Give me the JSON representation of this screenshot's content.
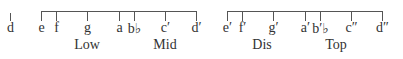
{
  "diagram": {
    "type": "pitch-range",
    "lone_note": {
      "label": "d",
      "x": 10
    },
    "brackets": [
      {
        "x_start": 41,
        "x_end": 196,
        "notes": [
          {
            "label": "e",
            "x": 41
          },
          {
            "label": "f",
            "x": 56
          },
          {
            "label": "g",
            "x": 87
          },
          {
            "label": "a",
            "x": 119
          },
          {
            "label": "b♭",
            "x": 134
          },
          {
            "label": "c′",
            "x": 165
          },
          {
            "label": "d′",
            "x": 196
          }
        ]
      },
      {
        "x_start": 227,
        "x_end": 382,
        "notes": [
          {
            "label": "e′",
            "x": 227
          },
          {
            "label": "f′",
            "x": 242
          },
          {
            "label": "g′",
            "x": 273
          },
          {
            "label": "a′",
            "x": 305
          },
          {
            "label": "b′♭",
            "x": 320
          },
          {
            "label": "c″",
            "x": 351
          },
          {
            "label": "d″",
            "x": 382
          }
        ]
      }
    ],
    "groups": [
      {
        "label": "Low",
        "x": 87
      },
      {
        "label": "Mid",
        "x": 165
      },
      {
        "label": "Dis",
        "x": 262
      },
      {
        "label": "Top",
        "x": 336
      }
    ]
  }
}
